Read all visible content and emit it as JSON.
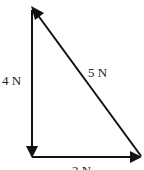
{
  "diagram": {
    "title": "",
    "vectors": [
      {
        "id": "vertical",
        "label": "4 N",
        "magnitude": 4,
        "unit": "N",
        "direction": "down"
      },
      {
        "id": "horizontal",
        "label": "3 N",
        "magnitude": 3,
        "unit": "N",
        "direction": "right"
      },
      {
        "id": "hypotenuse",
        "label": "5 N",
        "magnitude": 5,
        "unit": "N",
        "direction": "up-left"
      }
    ],
    "colors": {
      "line": "#111111",
      "text": "#222222",
      "background": "#ffffff"
    }
  }
}
